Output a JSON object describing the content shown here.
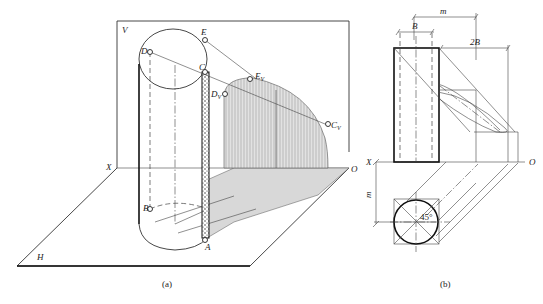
{
  "figure_a": {
    "caption": "(a)",
    "planes": {
      "v_label": "V",
      "h_label": "H",
      "x_label": "X",
      "o_label": "O"
    },
    "points": {
      "A": "A",
      "B": "B",
      "C": "C",
      "D": "D",
      "E": "E",
      "Cv": "C",
      "Cv_sub": "V",
      "Dv": "D",
      "Dv_sub": "V",
      "Ev": "E",
      "Ev_sub": "V"
    }
  },
  "figure_b": {
    "caption": "(b)",
    "dimensions": {
      "B": "B",
      "m_top": "m",
      "two_B": "2B",
      "m_side": "m"
    },
    "angle": "45°",
    "axis": {
      "x_label": "X",
      "o_label": "O"
    }
  },
  "colors": {
    "line": "#222222",
    "shadow_fill": "#cfcfcf",
    "background": "#ffffff"
  }
}
